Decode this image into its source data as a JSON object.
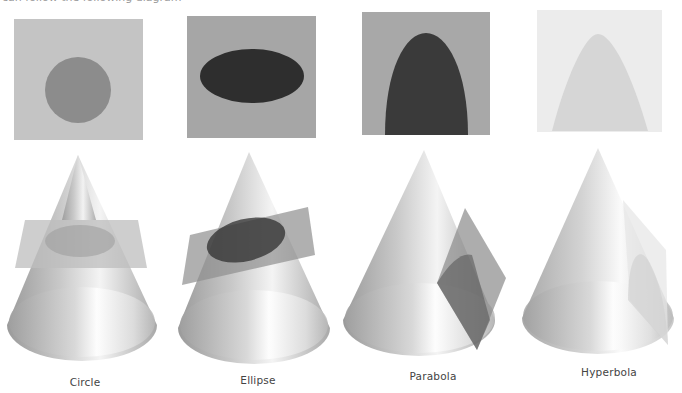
{
  "header": {
    "clipped_caption": "can follow the following diagram"
  },
  "colors": {
    "circle_panel_bg": "#c4c4c4",
    "circle_fill": "#8c8c8c",
    "ellipse_panel_bg": "#a6a6a6",
    "ellipse_fill": "#2e2e2e",
    "parabola_panel_bg": "#a8a8a8",
    "parabola_fill": "#3a3a3a",
    "hyperbola_panel_bg": "#ececec",
    "hyperbola_fill": "#d6d6d6"
  },
  "sections": [
    {
      "id": "circle",
      "label": "Circle",
      "cross_section": "circle",
      "plane_orientation": "horizontal"
    },
    {
      "id": "ellipse",
      "label": "Ellipse",
      "cross_section": "ellipse",
      "plane_orientation": "tilted"
    },
    {
      "id": "parabola",
      "label": "Parabola",
      "cross_section": "parabola",
      "plane_orientation": "parallel to side"
    },
    {
      "id": "hyperbola",
      "label": "Hyperbola",
      "cross_section": "hyperbola",
      "plane_orientation": "vertical"
    }
  ]
}
